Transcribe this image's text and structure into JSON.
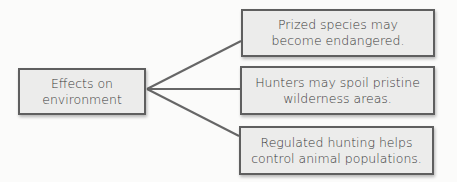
{
  "diagram": {
    "root": {
      "lines": [
        "Effects on",
        "environment"
      ]
    },
    "children": [
      {
        "lines": [
          "Prized species may",
          "become endangered."
        ]
      },
      {
        "lines": [
          "Hunters may spoil pristine",
          "wilderness areas."
        ]
      },
      {
        "lines": [
          "Regulated hunting helps",
          "control animal populations."
        ]
      }
    ],
    "colors": {
      "box_fill": "#ececeb",
      "box_border": "#5f5f5f",
      "connector": "#666666",
      "text": "#3a3a3a"
    }
  }
}
